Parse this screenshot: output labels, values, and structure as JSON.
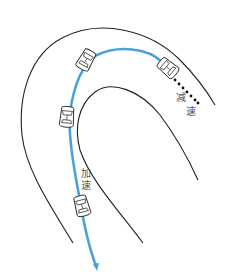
{
  "diagram": {
    "type": "driving-through-curve",
    "colors": {
      "road_edge": "#222222",
      "path": "#4aa3d8",
      "decel_dots": "#111111",
      "car_outline": "#222222",
      "label_text": "#555555",
      "background": "#ffffff"
    },
    "labels": {
      "decelerate": {
        "char1": "减",
        "char2": "速"
      },
      "accelerate": {
        "char1": "加",
        "char2": "速"
      }
    },
    "cars": [
      {
        "id": "car-entry",
        "x": 168,
        "y": 68,
        "rotate": 40
      },
      {
        "id": "car-apex",
        "x": 86,
        "y": 60,
        "rotate": -150
      },
      {
        "id": "car-mid-exit",
        "x": 67,
        "y": 117,
        "rotate": -175
      },
      {
        "id": "car-exit",
        "x": 82,
        "y": 206,
        "rotate": 165
      }
    ]
  }
}
